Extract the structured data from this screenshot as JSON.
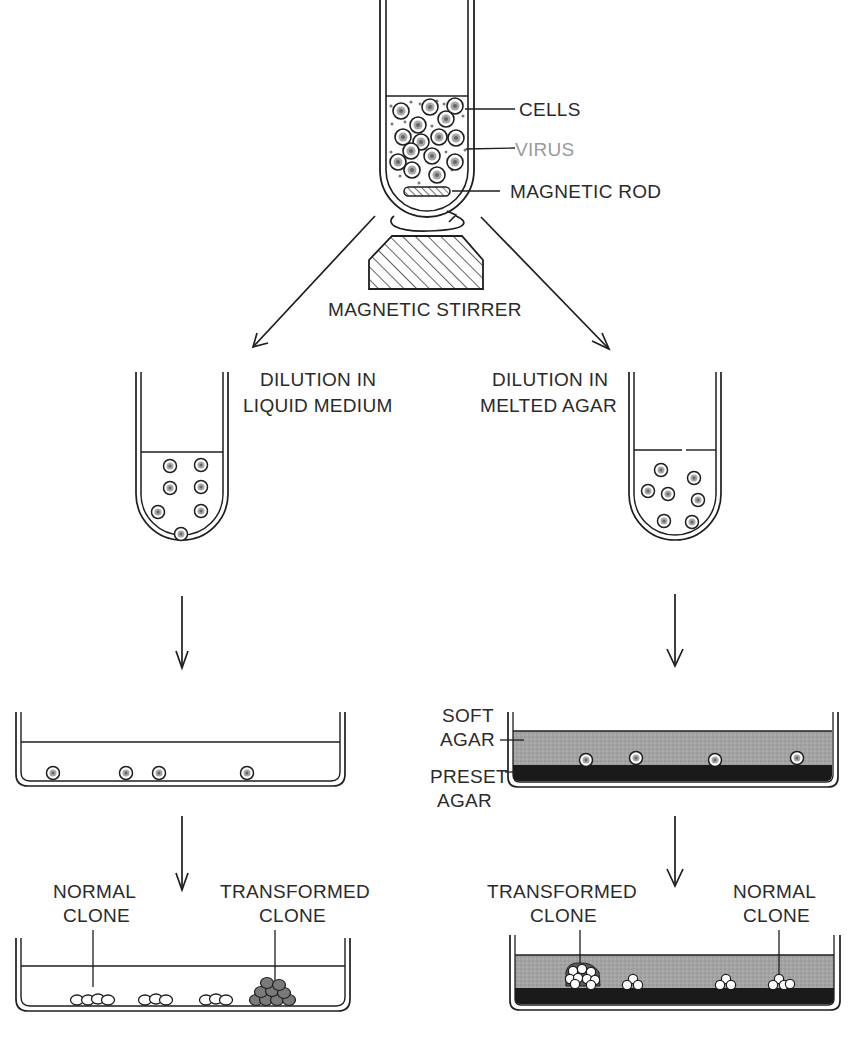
{
  "top_tube": {
    "labels": {
      "cells": "CELLS",
      "virus": "VIRUS",
      "magnetic_rod": "MAGNETIC ROD",
      "magnetic_stirrer": "MAGNETIC STIRRER"
    }
  },
  "left_branch": {
    "tube_label_line1": "DILUTION IN",
    "tube_label_line2": "LIQUID MEDIUM",
    "tube_cell_count": 7,
    "dish1_cell_count": 4,
    "dish2_labels": {
      "normal_line1": "NORMAL",
      "normal_line2": "CLONE",
      "transformed_line1": "TRANSFORMED",
      "transformed_line2": "CLONE"
    }
  },
  "right_branch": {
    "tube_label_line1": "DILUTION IN",
    "tube_label_line2": "MELTED AGAR",
    "tube_cell_count": 7,
    "dish1_labels": {
      "soft_agar_line1": "SOFT",
      "soft_agar_line2": "AGAR",
      "preset_agar_line1": "PRESET",
      "preset_agar_line2": "AGAR"
    },
    "dish1_cell_count": 4,
    "dish2_labels": {
      "transformed_line1": "TRANSFORMED",
      "transformed_line2": "CLONE",
      "normal_line1": "NORMAL",
      "normal_line2": "CLONE"
    }
  },
  "colors": {
    "ink": "#1e1e1e",
    "soft_agar": "#9c9c9c",
    "preset_agar": "#1a1a1a",
    "transformed_cell": "#7a7a7a",
    "virus_label": "#9a9a9a"
  }
}
